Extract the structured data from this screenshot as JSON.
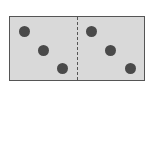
{
  "figure": {
    "type": "domino",
    "left_half": {
      "pips": 3
    },
    "right_half": {
      "pips": 3
    },
    "divider_style": "dashed",
    "colors": {
      "tile_fill": "#d9d9d9",
      "pip": "#4a4a4a",
      "border": "#555555"
    }
  }
}
